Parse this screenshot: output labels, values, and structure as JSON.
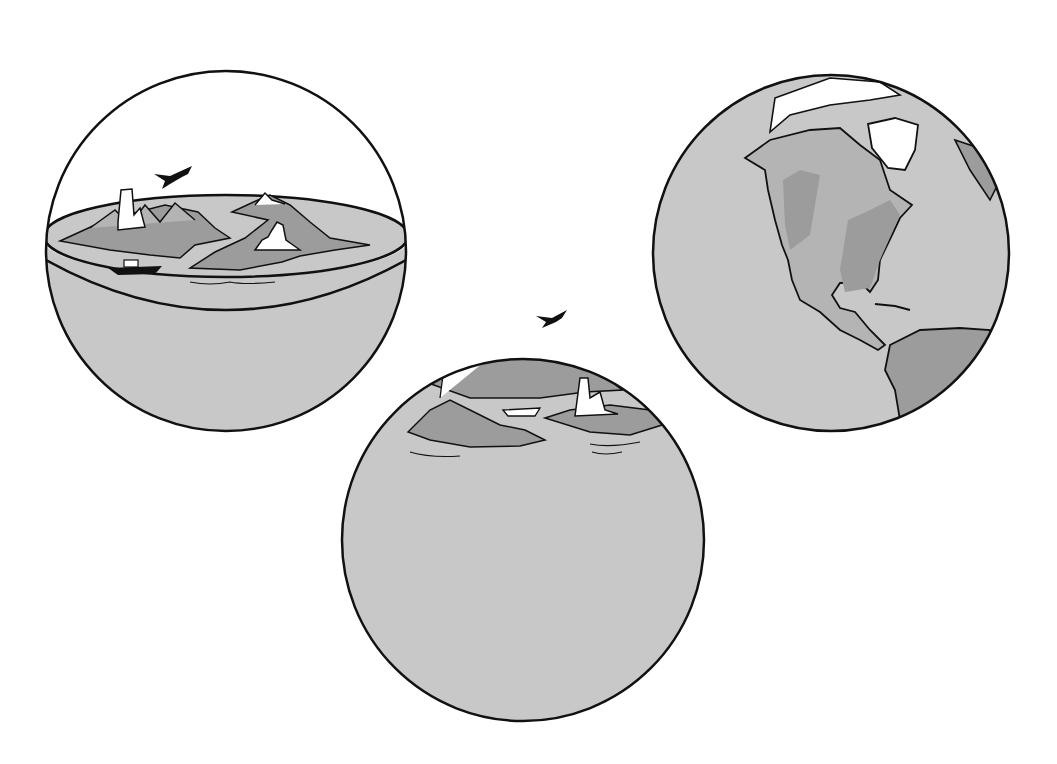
{
  "figure": {
    "colors": {
      "background": "#ffffff",
      "ocean": "#c8c8c8",
      "land_dark": "#9c9c9c",
      "land_light": "#b4b4b4",
      "snow": "#ffffff",
      "outline": "#111111"
    },
    "panels": [
      {
        "id": "flat-disk-in-sphere",
        "label": "Flat earth disk inside a sphere",
        "elements": [
          "airplane",
          "ship",
          "city",
          "mountains",
          "islands"
        ]
      },
      {
        "id": "small-curved-earth",
        "label": "Land on top of a ball",
        "elements": [
          "airplane",
          "ship",
          "city",
          "mountains",
          "islands"
        ]
      },
      {
        "id": "real-globe",
        "label": "Globe showing the Americas",
        "elements": [
          "North America",
          "South America",
          "Greenland",
          "Caribbean"
        ]
      }
    ]
  }
}
